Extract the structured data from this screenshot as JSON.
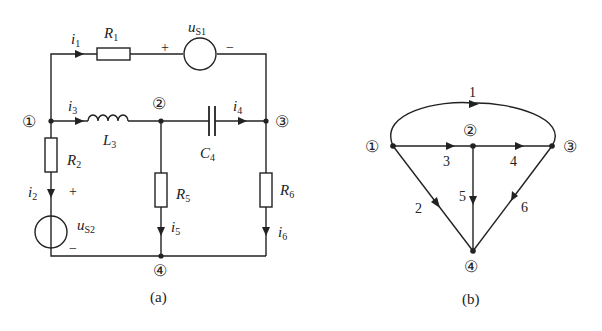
{
  "circuit_a": {
    "caption": "(a)",
    "nodes": [
      {
        "id": "1",
        "label": "①"
      },
      {
        "id": "2",
        "label": "②"
      },
      {
        "id": "3",
        "label": "③"
      },
      {
        "id": "4",
        "label": "④"
      }
    ],
    "elements": {
      "R1": {
        "main": "R",
        "sub": "1"
      },
      "uS1": {
        "main": "u",
        "sub": "S1",
        "plus": "+",
        "minus": "−"
      },
      "L3": {
        "main": "L",
        "sub": "3"
      },
      "C4": {
        "main": "C",
        "sub": "4"
      },
      "R2": {
        "main": "R",
        "sub": "2"
      },
      "uS2": {
        "main": "u",
        "sub": "S2",
        "plus": "+",
        "minus": "−"
      },
      "R5": {
        "main": "R",
        "sub": "5"
      },
      "R6": {
        "main": "R",
        "sub": "6"
      }
    },
    "currents": {
      "i1": {
        "main": "i",
        "sub": "1"
      },
      "i2": {
        "main": "i",
        "sub": "2"
      },
      "i3": {
        "main": "i",
        "sub": "3"
      },
      "i4": {
        "main": "i",
        "sub": "4"
      },
      "i5": {
        "main": "i",
        "sub": "5"
      },
      "i6": {
        "main": "i",
        "sub": "6"
      }
    }
  },
  "graph_b": {
    "caption": "(b)",
    "nodes": [
      {
        "id": "1",
        "label": "①"
      },
      {
        "id": "2",
        "label": "②"
      },
      {
        "id": "3",
        "label": "③"
      },
      {
        "id": "4",
        "label": "④"
      }
    ],
    "branches": [
      {
        "label": "1",
        "from": "1",
        "to": "3"
      },
      {
        "label": "2",
        "from": "1",
        "to": "4"
      },
      {
        "label": "3",
        "from": "1",
        "to": "2"
      },
      {
        "label": "4",
        "from": "2",
        "to": "3"
      },
      {
        "label": "5",
        "from": "2",
        "to": "4"
      },
      {
        "label": "6",
        "from": "3",
        "to": "4"
      }
    ]
  }
}
